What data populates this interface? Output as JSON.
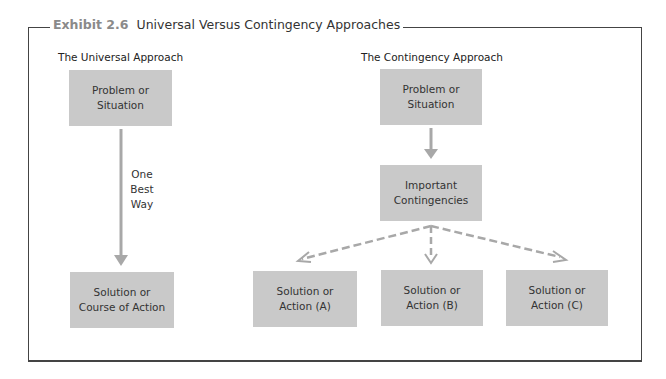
{
  "exhibit": {
    "number": "Exhibit 2.6",
    "title": "Universal Versus Contingency Approaches"
  },
  "universal": {
    "label": "The Universal Approach",
    "problem_box": "Problem or\nSituation",
    "arrow_label": "One\nBest\nWay",
    "solution_box": "Solution or\nCourse of Action"
  },
  "contingency": {
    "label": "The Contingency Approach",
    "problem_box": "Problem or\nSituation",
    "contingencies_box": "Important\nContingencies",
    "solutions": [
      {
        "label": "Solution or\nAction (A)"
      },
      {
        "label": "Solution or\nAction (B)"
      },
      {
        "label": "Solution or\nAction (C)"
      }
    ]
  },
  "colors": {
    "box_fill": "#c9c9c9",
    "arrow": "#a8a8a8",
    "frame": "#444444",
    "exhibit_number": "#8a8a8a"
  }
}
